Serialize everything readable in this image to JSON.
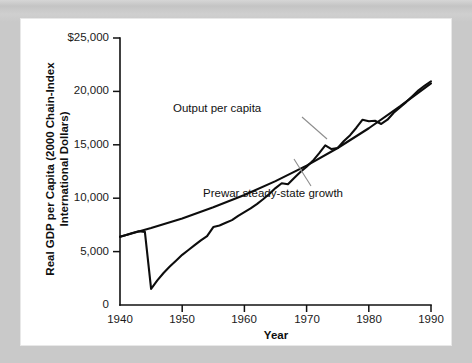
{
  "figure": {
    "frame_color": "#c9c9c9",
    "card_color": "#ffffff",
    "ink_color": "#0d0d0d"
  },
  "chart_data": {
    "type": "line",
    "title": "",
    "xlabel": "Year",
    "ylabel": "Real GDP per Capita (2000 Chain-Index International Dollars)",
    "ylabel_line1": "Real GDP per Capita (2000 Chain-Index",
    "ylabel_line2": "International Dollars)",
    "xlim": [
      1940,
      1990
    ],
    "ylim": [
      0,
      25000
    ],
    "grid": false,
    "legend_position": "inline-annotations",
    "xticks": [
      1940,
      1950,
      1960,
      1970,
      1980,
      1990
    ],
    "xtick_labels": [
      "1940",
      "1950",
      "1960",
      "1970",
      "1980",
      "1990"
    ],
    "yticks": [
      0,
      5000,
      10000,
      15000,
      20000,
      25000
    ],
    "ytick_labels": [
      "0",
      "5,000",
      "10,000",
      "15,000",
      "20,000",
      "$25,000"
    ],
    "annotations": [
      {
        "text": "Output per capita",
        "series": "output_per_capita"
      },
      {
        "text": "Prewar steady-state growth",
        "series": "prewar_steady_state_growth"
      }
    ],
    "series": [
      {
        "name": "Output per capita",
        "x": [
          1940,
          1941,
          1942,
          1943,
          1944,
          1945,
          1946,
          1947,
          1948,
          1949,
          1950,
          1951,
          1952,
          1953,
          1954,
          1955,
          1956,
          1957,
          1958,
          1959,
          1960,
          1961,
          1962,
          1963,
          1964,
          1965,
          1966,
          1967,
          1968,
          1969,
          1970,
          1971,
          1972,
          1973,
          1974,
          1975,
          1976,
          1977,
          1978,
          1979,
          1980,
          1981,
          1982,
          1983,
          1984,
          1985,
          1986,
          1987,
          1988,
          1989,
          1990
        ],
        "values": [
          6400,
          6550,
          6750,
          6900,
          6850,
          1500,
          2300,
          3000,
          3600,
          4150,
          4700,
          5150,
          5600,
          6050,
          6450,
          7300,
          7450,
          7700,
          7950,
          8350,
          8700,
          9050,
          9450,
          9900,
          10400,
          10950,
          11400,
          11300,
          11900,
          12450,
          12950,
          13500,
          14200,
          14950,
          14600,
          14700,
          15350,
          15900,
          16600,
          17350,
          17200,
          17250,
          16950,
          17350,
          18000,
          18500,
          19000,
          19550,
          20100,
          20550,
          20950
        ]
      },
      {
        "name": "Prewar steady-state growth",
        "x": [
          1940,
          1945,
          1950,
          1955,
          1960,
          1965,
          1970,
          1975,
          1980,
          1985,
          1990
        ],
        "values": [
          6400,
          7200,
          8100,
          9150,
          10300,
          11600,
          13050,
          14700,
          16550,
          18600,
          20750
        ]
      }
    ]
  }
}
